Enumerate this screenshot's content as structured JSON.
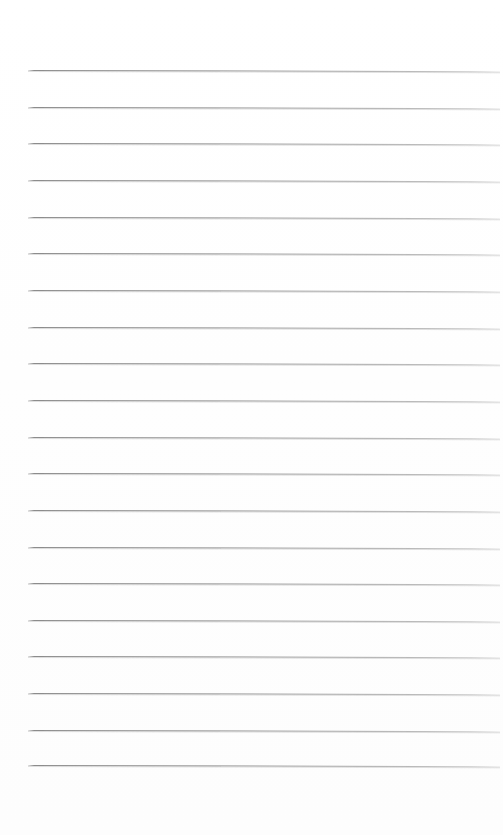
{
  "document": {
    "kind": "scanned-blank-ruled-paper",
    "title": "",
    "body_text": "",
    "visible_text_content": "",
    "page_width_px": 503,
    "page_height_px": 835,
    "background_color": "#ffffff",
    "orientation": "portrait"
  },
  "ruling": {
    "line_color": "#8a8a8a",
    "line_shadow_color": "#cdcdcd",
    "line_thickness_px": 1,
    "line_count": 20,
    "line_start_x_px": 28,
    "line_end_x_px": 500,
    "first_line_y_px": 70,
    "last_line_y_px": 765,
    "line_spacing_px": 36.6,
    "skew_deg": 0.15,
    "lines": [
      {
        "index": 1,
        "y": 70,
        "x1": 28,
        "x2": 500
      },
      {
        "index": 2,
        "y": 107,
        "x1": 28,
        "x2": 500
      },
      {
        "index": 3,
        "y": 143,
        "x1": 28,
        "x2": 500
      },
      {
        "index": 4,
        "y": 180,
        "x1": 28,
        "x2": 500
      },
      {
        "index": 5,
        "y": 217,
        "x1": 28,
        "x2": 500
      },
      {
        "index": 6,
        "y": 253,
        "x1": 28,
        "x2": 500
      },
      {
        "index": 7,
        "y": 290,
        "x1": 28,
        "x2": 500
      },
      {
        "index": 8,
        "y": 327,
        "x1": 28,
        "x2": 500
      },
      {
        "index": 9,
        "y": 363,
        "x1": 28,
        "x2": 500
      },
      {
        "index": 10,
        "y": 400,
        "x1": 28,
        "x2": 500
      },
      {
        "index": 11,
        "y": 437,
        "x1": 28,
        "x2": 500
      },
      {
        "index": 12,
        "y": 473,
        "x1": 28,
        "x2": 500
      },
      {
        "index": 13,
        "y": 510,
        "x1": 28,
        "x2": 500
      },
      {
        "index": 14,
        "y": 547,
        "x1": 28,
        "x2": 500
      },
      {
        "index": 15,
        "y": 583,
        "x1": 28,
        "x2": 500
      },
      {
        "index": 16,
        "y": 620,
        "x1": 28,
        "x2": 500
      },
      {
        "index": 17,
        "y": 656,
        "x1": 28,
        "x2": 500
      },
      {
        "index": 18,
        "y": 693,
        "x1": 28,
        "x2": 500
      },
      {
        "index": 19,
        "y": 730,
        "x1": 28,
        "x2": 500
      },
      {
        "index": 20,
        "y": 765,
        "x1": 28,
        "x2": 500
      }
    ]
  },
  "margins": {
    "top_px": 68,
    "bottom_px": 66,
    "left_px": 28,
    "right_px": 3
  }
}
